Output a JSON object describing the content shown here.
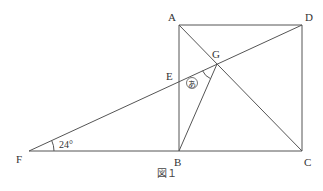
{
  "figure": {
    "caption": "図１",
    "points": {
      "A": {
        "label": "A",
        "x": 179,
        "y": 25
      },
      "D": {
        "label": "D",
        "x": 302,
        "y": 25
      },
      "B": {
        "label": "B",
        "x": 179,
        "y": 151
      },
      "C": {
        "label": "C",
        "x": 302,
        "y": 151
      },
      "E": {
        "label": "E",
        "x": 179,
        "y": 82
      },
      "G": {
        "label": "G",
        "x": 217,
        "y": 64
      },
      "F": {
        "label": "F",
        "x": 29,
        "y": 151
      }
    },
    "angle_F": "24°",
    "angle_unknown": "あ",
    "line_color": "#555555"
  }
}
